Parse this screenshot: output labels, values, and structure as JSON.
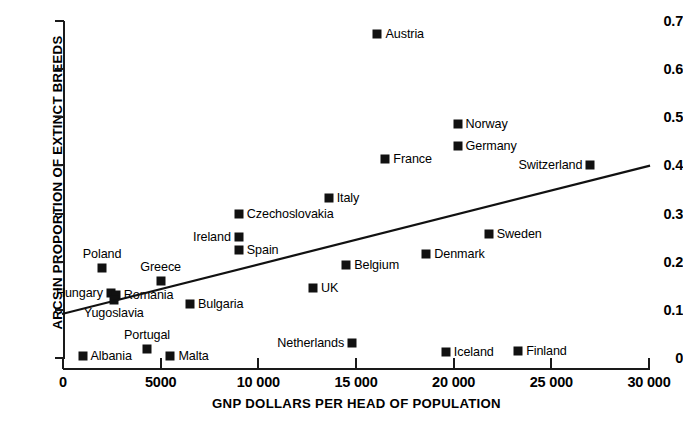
{
  "chart_data": {
    "type": "scatter",
    "title": "",
    "xlabel": "GNP DOLLARS PER HEAD OF POPULATION",
    "ylabel": "ARCSIN PROPORTION OF EXTINCT BREEDS",
    "xlim": [
      0,
      30000
    ],
    "ylim": [
      0,
      0.7
    ],
    "grid": false,
    "legend": "none",
    "xticks": [
      0,
      5000,
      10000,
      15000,
      20000,
      25000,
      30000
    ],
    "xticklabels": [
      "0",
      "5000",
      "10 000",
      "15 000",
      "20 000",
      "25 000",
      "30 000"
    ],
    "yticks": [
      0,
      0.1,
      0.2,
      0.3,
      0.4,
      0.5,
      0.6,
      0.7
    ],
    "yticklabels": [
      "0",
      "0.1",
      "0.2",
      "0.3",
      "0.4",
      "0.5",
      "0.6",
      "0.7"
    ],
    "marker": "filled-square",
    "marker_color": "#111111",
    "points": [
      {
        "label": "Austria",
        "x": 16100,
        "y": 0.672,
        "side": "right"
      },
      {
        "label": "Norway",
        "x": 20200,
        "y": 0.486,
        "side": "right"
      },
      {
        "label": "Germany",
        "x": 20200,
        "y": 0.441,
        "side": "right"
      },
      {
        "label": "France",
        "x": 16500,
        "y": 0.414,
        "side": "right"
      },
      {
        "label": "Switzerland",
        "x": 27000,
        "y": 0.401,
        "side": "left"
      },
      {
        "label": "Italy",
        "x": 13600,
        "y": 0.333,
        "side": "right"
      },
      {
        "label": "Czechoslovakia",
        "x": 9000,
        "y": 0.3,
        "side": "right"
      },
      {
        "label": "Sweden",
        "x": 21800,
        "y": 0.258,
        "side": "right"
      },
      {
        "label": "Ireland",
        "x": 9000,
        "y": 0.251,
        "side": "left"
      },
      {
        "label": "Spain",
        "x": 9000,
        "y": 0.224,
        "side": "right"
      },
      {
        "label": "Denmark",
        "x": 18600,
        "y": 0.216,
        "side": "right"
      },
      {
        "label": "Belgium",
        "x": 14500,
        "y": 0.194,
        "side": "right"
      },
      {
        "label": "Poland",
        "x": 2000,
        "y": 0.187,
        "side": "above"
      },
      {
        "label": "Greece",
        "x": 5000,
        "y": 0.16,
        "side": "above"
      },
      {
        "label": "UK",
        "x": 12800,
        "y": 0.145,
        "side": "right"
      },
      {
        "label": "Hungary",
        "x": 2450,
        "y": 0.136,
        "side": "left"
      },
      {
        "label": "Romania",
        "x": 2700,
        "y": 0.13,
        "side": "right"
      },
      {
        "label": "Yugoslavia",
        "x": 2600,
        "y": 0.12,
        "side": "below"
      },
      {
        "label": "Bulgaria",
        "x": 6500,
        "y": 0.112,
        "side": "right"
      },
      {
        "label": "Netherlands",
        "x": 14800,
        "y": 0.032,
        "side": "left"
      },
      {
        "label": "Portugal",
        "x": 4300,
        "y": 0.018,
        "side": "above"
      },
      {
        "label": "Finland",
        "x": 23300,
        "y": 0.015,
        "side": "right"
      },
      {
        "label": "Iceland",
        "x": 19600,
        "y": 0.012,
        "side": "right"
      },
      {
        "label": "Albania",
        "x": 1000,
        "y": 0.004,
        "side": "right"
      },
      {
        "label": "Malta",
        "x": 5500,
        "y": 0.004,
        "side": "right"
      }
    ],
    "trend_line": {
      "x0": 0,
      "y0": 0.092,
      "x1": 30000,
      "y1": 0.399,
      "color": "#111111"
    }
  }
}
